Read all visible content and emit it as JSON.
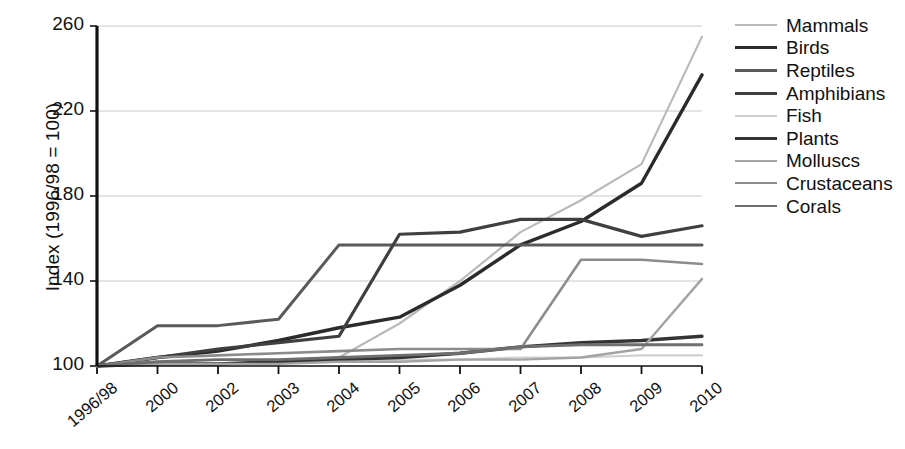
{
  "chart_data": {
    "type": "line",
    "title": "",
    "xlabel": "",
    "ylabel": "Index (1996/98 = 100)",
    "categories": [
      "1996/98",
      "2000",
      "2002",
      "2003",
      "2004",
      "2005",
      "2006",
      "2007",
      "2008",
      "2009",
      "2010"
    ],
    "ylim": [
      100,
      260
    ],
    "yticks": [
      100,
      140,
      180,
      220,
      260
    ],
    "grid": "horizontal",
    "legend_position": "right",
    "series": [
      {
        "name": "Mammals",
        "color": "#b9b9b9",
        "values": [
          100,
          101,
          101,
          102,
          104,
          120,
          140,
          163,
          178,
          195,
          255
        ]
      },
      {
        "name": "Birds",
        "color": "#2b2b2b",
        "values": [
          100,
          104,
          107,
          112,
          118,
          123,
          138,
          157,
          168,
          186,
          237
        ]
      },
      {
        "name": "Reptiles",
        "color": "#5a5a5a",
        "values": [
          100,
          119,
          119,
          122,
          157,
          157,
          157,
          157,
          157,
          157,
          157
        ]
      },
      {
        "name": "Amphibians",
        "color": "#3f3f3f",
        "values": [
          100,
          104,
          108,
          111,
          114,
          162,
          163,
          169,
          169,
          161,
          166
        ]
      },
      {
        "name": "Fish",
        "color": "#cfcfcf",
        "values": [
          100,
          101,
          101,
          102,
          102,
          103,
          103,
          104,
          104,
          105,
          105
        ]
      },
      {
        "name": "Plants",
        "color": "#343434",
        "values": [
          100,
          101,
          101,
          102,
          103,
          104,
          106,
          109,
          111,
          112,
          114
        ]
      },
      {
        "name": "Molluscs",
        "color": "#a3a3a3",
        "values": [
          100,
          101,
          101,
          101,
          102,
          102,
          103,
          103,
          104,
          108,
          141
        ]
      },
      {
        "name": "Crustaceans",
        "color": "#8c8c8c",
        "values": [
          100,
          104,
          105,
          106,
          107,
          108,
          108,
          108,
          150,
          150,
          148
        ]
      },
      {
        "name": "Corals",
        "color": "#6e6e6e",
        "values": [
          100,
          102,
          103,
          103,
          104,
          105,
          106,
          109,
          110,
          110,
          110
        ]
      }
    ]
  },
  "axes": {
    "y_title": "Index (1996/98 = 100)",
    "y_labels": [
      "260",
      "220",
      "180",
      "140",
      "100"
    ],
    "x_labels": [
      "1996/98",
      "2000",
      "2002",
      "2003",
      "2004",
      "2005",
      "2006",
      "2007",
      "2008",
      "2009",
      "2010"
    ]
  },
  "legend": {
    "items": [
      {
        "label": "Mammals",
        "color": "#b9b9b9",
        "weight": "2.2"
      },
      {
        "label": "Birds",
        "color": "#2b2b2b",
        "weight": "3.4"
      },
      {
        "label": "Reptiles",
        "color": "#5a5a5a",
        "weight": "3.0"
      },
      {
        "label": "Amphibians",
        "color": "#3f3f3f",
        "weight": "3.2"
      },
      {
        "label": "Fish",
        "color": "#cfcfcf",
        "weight": "2.2"
      },
      {
        "label": "Plants",
        "color": "#343434",
        "weight": "3.4"
      },
      {
        "label": "Molluscs",
        "color": "#a3a3a3",
        "weight": "2.4"
      },
      {
        "label": "Crustaceans",
        "color": "#8c8c8c",
        "weight": "2.6"
      },
      {
        "label": "Corals",
        "color": "#6e6e6e",
        "weight": "2.8"
      }
    ]
  },
  "caption": {
    "text": ""
  }
}
